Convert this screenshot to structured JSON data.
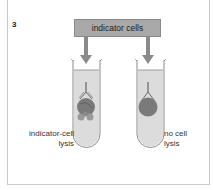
{
  "panel": {
    "number": "3"
  },
  "label_box": {
    "text": "indicator cells"
  },
  "tubes": [
    {
      "id": "left",
      "caption_line1": "indicator-cell",
      "caption_line2": "lysis",
      "state": "lysed"
    },
    {
      "id": "right",
      "caption_line1": "no cell",
      "caption_line2": "lysis",
      "state": "intact"
    }
  ],
  "colors": {
    "box_fill": "#a9a9a9",
    "arrow": "#8a8a8a",
    "tube_fill": "#dcdcdc",
    "tube_outline": "#8a8a8a",
    "cell_fill": "#7a7a7a",
    "fragment_fill": "#9a9a9a"
  }
}
